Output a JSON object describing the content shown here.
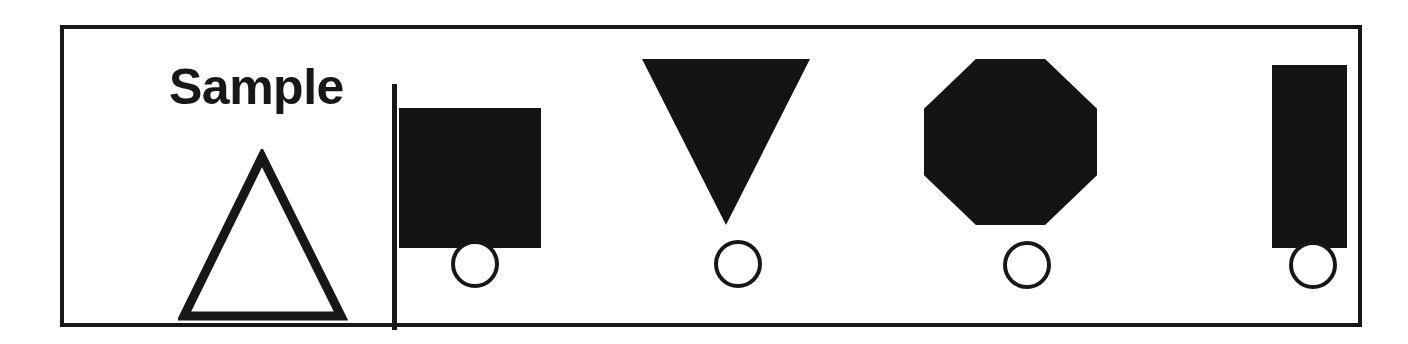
{
  "page": {
    "background_color": "#ffffff",
    "ink_color": "#171717",
    "fill_color": "#141414"
  },
  "panel": {
    "border_color": "#171717",
    "border_width_px": 4
  },
  "sample": {
    "label": "Sample",
    "shape": {
      "name": "triangle",
      "style": "outline",
      "orientation": "point-up"
    }
  },
  "divider": {
    "name": "vertical-rule",
    "color": "#171717"
  },
  "options": [
    {
      "index": 1,
      "shape": "square",
      "style": "filled",
      "orientation": "upright",
      "bubble_label": "",
      "selected": false
    },
    {
      "index": 2,
      "shape": "triangle",
      "style": "filled",
      "orientation": "point-down",
      "bubble_label": "",
      "selected": false
    },
    {
      "index": 3,
      "shape": "octagon",
      "style": "filled",
      "orientation": "upright",
      "bubble_label": "",
      "selected": false
    },
    {
      "index": 4,
      "shape": "rectangle",
      "style": "filled",
      "orientation": "vertical",
      "bubble_label": "",
      "selected": false
    }
  ]
}
